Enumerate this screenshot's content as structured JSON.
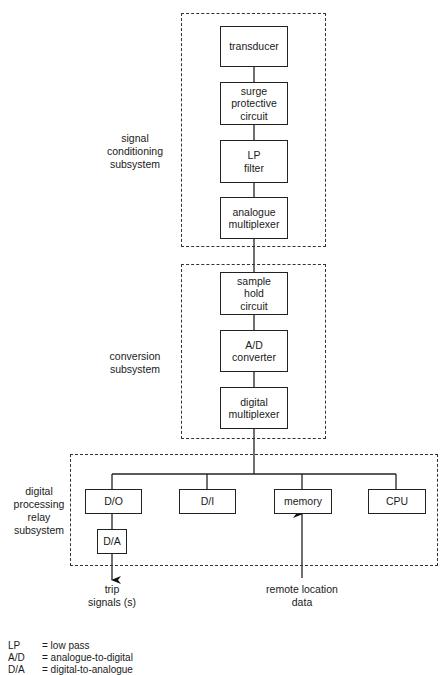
{
  "groups": {
    "signal": {
      "label": "signal\nconditioning\nsubsystem"
    },
    "conversion": {
      "label": "conversion\nsubsystem"
    },
    "digital": {
      "label": "digital\nprocessing\nrelay\nsubsystem"
    }
  },
  "blocks": {
    "transducer": "transducer",
    "surge": "surge\nprotective\ncircuit",
    "lp_filter": "LP\nfilter",
    "analogue_mux": "analogue\nmultiplexer",
    "sample_hold": "sample\nhold\ncircuit",
    "ad_converter": "A/D\nconverter",
    "digital_mux": "digital\nmultiplexer",
    "do": "D/O",
    "di": "D/I",
    "memory": "memory",
    "cpu": "CPU",
    "da": "D/A"
  },
  "io": {
    "trip": "trip\nsignals (s)",
    "remote": "remote location\ndata"
  },
  "legend": [
    {
      "abbr": "LP",
      "meaning": "= low pass"
    },
    {
      "abbr": "A/D",
      "meaning": "= analogue-to-digital"
    },
    {
      "abbr": "D/A",
      "meaning": "= digital-to-analogue"
    }
  ]
}
